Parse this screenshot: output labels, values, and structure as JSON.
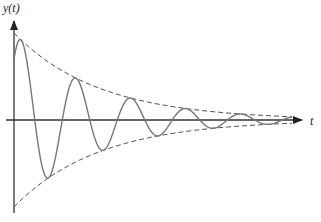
{
  "chart_data": {
    "type": "line",
    "title": "",
    "xlabel": "t",
    "ylabel": "y(t)",
    "grid": false,
    "legend": null,
    "series": [
      {
        "name": "y(t) damped oscillation",
        "style": "solid",
        "color": "#777777",
        "formula": "A*exp(-k*t)*cos(w*t+phi)",
        "peaks_px": [
          [
            21,
            40
          ],
          [
            77,
            79
          ],
          [
            132,
            98
          ],
          [
            185,
            109
          ],
          [
            238,
            115
          ]
        ],
        "troughs_px": [
          [
            49,
            178
          ],
          [
            103,
            150
          ],
          [
            158,
            138
          ],
          [
            212,
            128
          ],
          [
            265,
            124
          ]
        ]
      },
      {
        "name": "upper envelope",
        "style": "dashed",
        "color": "#555555",
        "formula": "A*exp(-k*t)"
      },
      {
        "name": "lower envelope",
        "style": "dashed",
        "color": "#555555",
        "formula": "-A*exp(-k*t)"
      }
    ],
    "params": {
      "A": 87,
      "k": 0.0118,
      "w": 0.1142,
      "phi": -0.8
    },
    "axes": {
      "origin_px": [
        14,
        120
      ],
      "x_end_px": 302,
      "y_top_px": 22,
      "y_bottom_px": 212
    }
  },
  "labels": {
    "y_axis": "y(t)",
    "x_axis": "t"
  },
  "colors": {
    "axis": "#333333",
    "curve": "#777777",
    "envelope": "#555555"
  }
}
